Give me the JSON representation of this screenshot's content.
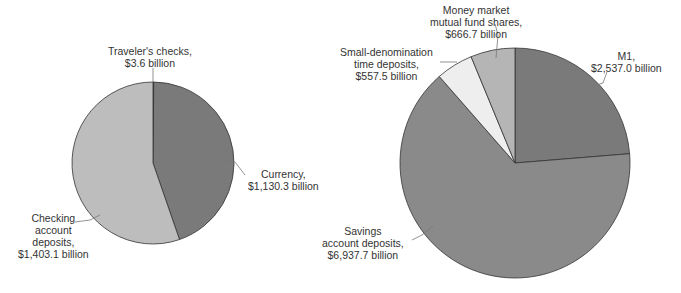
{
  "chart_data": [
    {
      "type": "pie",
      "title": "M1",
      "slices": [
        {
          "label": "Traveler's checks",
          "value": 3.6,
          "display": "$3.6 billion",
          "color": "#6f6f6f"
        },
        {
          "label": "Currency",
          "value": 1130.3,
          "display": "$1,130.3 billion",
          "color": "#7a7a7a"
        },
        {
          "label": "Checking account deposits",
          "value": 1403.1,
          "display": "$1,403.1 billion",
          "color": "#bdbdbd"
        }
      ],
      "unit": "billion dollars"
    },
    {
      "type": "pie",
      "title": "M2",
      "slices": [
        {
          "label": "M1",
          "value": 2537.0,
          "display": "$2,537.0 billion",
          "color": "#7a7a7a"
        },
        {
          "label": "Savings account deposits",
          "value": 6937.7,
          "display": "$6,937.7 billion",
          "color": "#8a8a8a"
        },
        {
          "label": "Small-denomination time deposits",
          "value": 557.5,
          "display": "$557.5 billion",
          "color": "#eeeeee"
        },
        {
          "label": "Money market mutual fund shares",
          "value": 666.7,
          "display": "$666.7 billion",
          "color": "#b5b5b5"
        }
      ],
      "unit": "billion dollars"
    }
  ],
  "labels": {
    "travelers": [
      "Traveler's checks,",
      "$3.6 billion"
    ],
    "currency": [
      "Currency,",
      "$1,130.3 billion"
    ],
    "checking": [
      "Checking",
      "account",
      "deposits,",
      "$1,403.1 billion"
    ],
    "money_market": [
      "Money market",
      "mutual fund shares,",
      "$666.7 billion"
    ],
    "small_denom": [
      "Small-denomination",
      "time deposits,",
      "$557.5 billion"
    ],
    "m1": [
      "M1,",
      "$2,537.0 billion"
    ],
    "savings": [
      "Savings",
      "account deposits,",
      "$6,937.7 billion"
    ]
  }
}
